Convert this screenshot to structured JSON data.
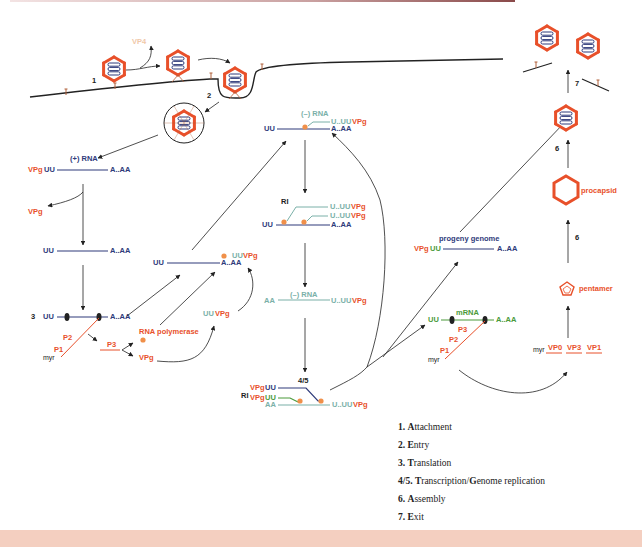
{
  "colors": {
    "plus_rna": "#2e3a7a",
    "minus_rna": "#7ab0a8",
    "mrna": "#4a9a3a",
    "vpg": "#e8502a",
    "protein": "#e8502a",
    "polymerase_dot": "#f0904a",
    "membrane": "#222222",
    "arrow": "#333333",
    "bottom_band": "#f4cfc0"
  },
  "labels": {
    "vp4": "VP4",
    "step1": "1",
    "step2": "2",
    "step3": "3",
    "step45": "4/5",
    "step6a": "6",
    "step6b": "6",
    "step7": "7",
    "plus_rna": "(+) RNA",
    "minus_rna": "(–) RNA",
    "vpg": "VPg",
    "uu": "UU",
    "aaa": "A..AA",
    "aa": "AA",
    "u_uuvpg_u": "U..UU",
    "uuvpg_uu": "UU",
    "ri": "RI",
    "p1": "P1",
    "p2": "P2",
    "p3": "P3",
    "myr": "myr",
    "rna_polymerase": "RNA polymerase",
    "mrna": "mRNA",
    "progeny_genome": "progeny genome",
    "procapsid": "procapsid",
    "pentamer": "pentamer",
    "vp0": "VP0",
    "vp3": "VP3",
    "vp1": "VP1"
  },
  "legend": [
    {
      "num": "1.",
      "initial": "A",
      "rest": "ttachment"
    },
    {
      "num": "2.",
      "initial": "E",
      "rest": "ntry"
    },
    {
      "num": "3.",
      "initial": "T",
      "rest": "ranslation"
    },
    {
      "num": "4/5.",
      "initial": "T",
      "rest": "ranscription/",
      "initial2": "G",
      "rest2": "enome replication"
    },
    {
      "num": "6.",
      "initial": "A",
      "rest": "ssembly"
    },
    {
      "num": "7.",
      "initial": "E",
      "rest": "xit"
    }
  ]
}
